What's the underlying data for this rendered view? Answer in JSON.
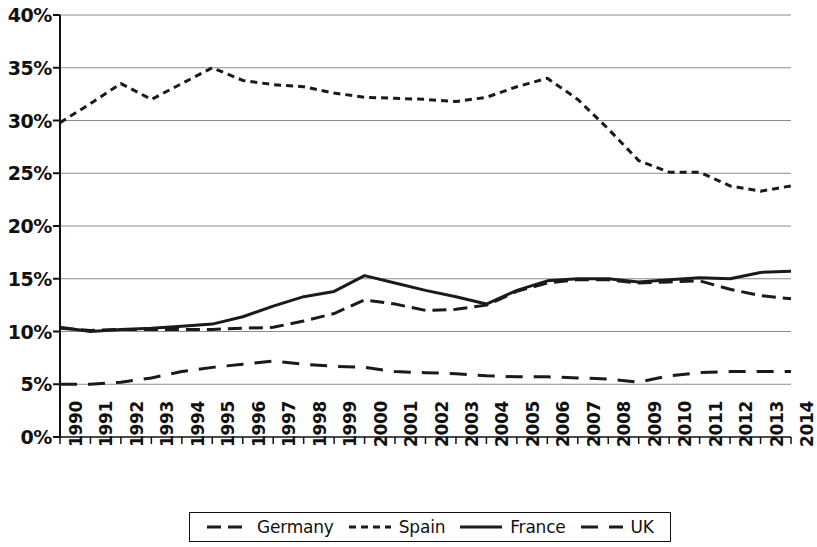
{
  "chart_data": {
    "type": "line",
    "title": "",
    "subtitle": "",
    "xlabel": "",
    "ylabel": "",
    "x": [
      1990,
      1991,
      1992,
      1993,
      1994,
      1995,
      1996,
      1997,
      1998,
      1999,
      2000,
      2001,
      2002,
      2003,
      2004,
      2005,
      2006,
      2007,
      2008,
      2009,
      2010,
      2011,
      2012,
      2013,
      2014
    ],
    "categories": [
      "1990",
      "1991",
      "1992",
      "1993",
      "1994",
      "1995",
      "1996",
      "1997",
      "1998",
      "1999",
      "2000",
      "2001",
      "2002",
      "2003",
      "2004",
      "2005",
      "2006",
      "2007",
      "2008",
      "2009",
      "2010",
      "2011",
      "2012",
      "2013",
      "2014"
    ],
    "xlim": [
      1990,
      2014
    ],
    "ylim": [
      0,
      40
    ],
    "y_tick_values": [
      0,
      5,
      10,
      15,
      20,
      25,
      30,
      35,
      40
    ],
    "y_tick_labels": [
      "0%",
      "5%",
      "10%",
      "15%",
      "20%",
      "25%",
      "30%",
      "35%",
      "40%"
    ],
    "y_unit": "%",
    "grid": "horizontal",
    "legend_position": "bottom",
    "series": [
      {
        "name": "Germany",
        "style": "dashed",
        "color": "#1a1a1a",
        "dasharray": "14,7",
        "width": 3,
        "values": [
          10.3,
          10.1,
          10.2,
          10.2,
          10.2,
          10.2,
          10.3,
          10.4,
          11.0,
          11.7,
          13.0,
          12.6,
          12.0,
          12.1,
          12.5,
          13.8,
          14.6,
          14.9,
          14.9,
          14.6,
          14.7,
          14.8,
          14.0,
          13.4,
          13.1
        ]
      },
      {
        "name": "Spain",
        "style": "fine-dashed",
        "color": "#1a1a1a",
        "dasharray": "7,5",
        "width": 3,
        "values": [
          29.8,
          31.6,
          33.5,
          32.0,
          33.5,
          35.0,
          33.8,
          33.4,
          33.2,
          32.6,
          32.2,
          32.1,
          32.0,
          31.8,
          32.2,
          33.2,
          34.0,
          32.0,
          29.2,
          26.2,
          25.1,
          25.1,
          23.8,
          23.3,
          23.8
        ]
      },
      {
        "name": "France",
        "style": "solid",
        "color": "#1a1a1a",
        "dasharray": "none",
        "width": 3,
        "values": [
          10.4,
          10.0,
          10.2,
          10.3,
          10.5,
          10.7,
          11.4,
          12.4,
          13.3,
          13.8,
          15.3,
          14.6,
          13.9,
          13.3,
          12.6,
          13.9,
          14.8,
          15.0,
          15.0,
          14.7,
          14.9,
          15.1,
          15.0,
          15.6,
          15.7
        ]
      },
      {
        "name": "UK",
        "style": "long-dashed",
        "color": "#1a1a1a",
        "dasharray": "17,11",
        "width": 3,
        "values": [
          5.0,
          5.0,
          5.2,
          5.6,
          6.2,
          6.6,
          6.9,
          7.2,
          6.9,
          6.7,
          6.6,
          6.2,
          6.1,
          6.0,
          5.8,
          5.7,
          5.7,
          5.6,
          5.5,
          5.2,
          5.8,
          6.1,
          6.2,
          6.2,
          6.2
        ]
      }
    ]
  },
  "legend": {
    "items": [
      {
        "label": "Germany"
      },
      {
        "label": "Spain"
      },
      {
        "label": "France"
      },
      {
        "label": "UK"
      }
    ]
  }
}
